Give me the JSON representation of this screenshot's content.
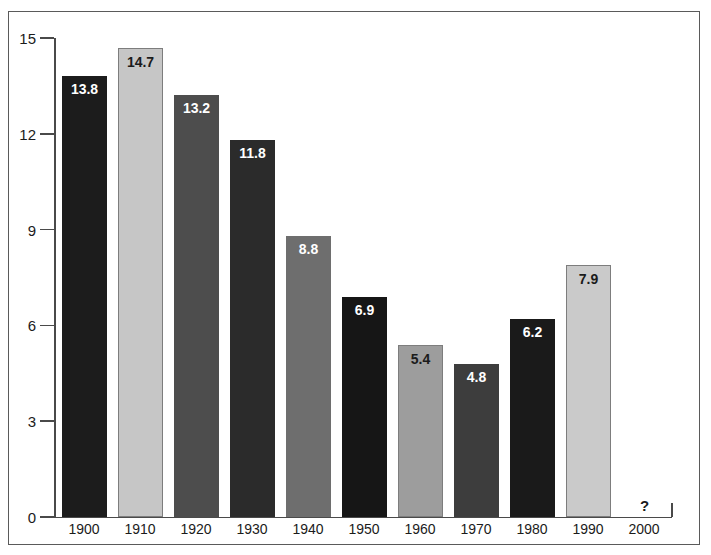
{
  "chart_data": {
    "type": "bar",
    "title": "",
    "subtitle": "",
    "xlabel": "",
    "ylabel": "",
    "categories": [
      "1900",
      "1910",
      "1920",
      "1930",
      "1940",
      "1950",
      "1960",
      "1970",
      "1980",
      "1990",
      "2000"
    ],
    "values": [
      13.8,
      14.7,
      13.2,
      11.8,
      8.8,
      6.9,
      5.4,
      4.8,
      6.2,
      7.9,
      null
    ],
    "value_labels": [
      "13.8",
      "14.7",
      "13.2",
      "11.8",
      "8.8",
      "6.9",
      "5.4",
      "4.8",
      "6.2",
      "7.9",
      "?"
    ],
    "bar_colors": [
      "#1c1c1c",
      "#c6c6c6",
      "#4d4d4d",
      "#2b2b2b",
      "#6e6e6e",
      "#161616",
      "#9d9d9d",
      "#3d3d3d",
      "#1a1a1a",
      "#cacaca",
      "none"
    ],
    "bar_label_color": [
      "#ffffff",
      "#1b1b1b",
      "#ffffff",
      "#ffffff",
      "#ffffff",
      "#ffffff",
      "#1b1b1b",
      "#ffffff",
      "#ffffff",
      "#1b1b1b",
      "#1b1b1b"
    ],
    "ylim": [
      0,
      15
    ],
    "yticks": [
      0,
      3,
      6,
      9,
      12,
      15
    ],
    "ytick_labels": [
      "0",
      "3",
      "6",
      "9",
      "12",
      "15"
    ],
    "grid": false,
    "legend": "none"
  },
  "axes": {
    "y_labels": [
      "15",
      "12",
      "9",
      "6",
      "3",
      "0"
    ],
    "x_labels": [
      "1900",
      "1910",
      "1920",
      "1930",
      "1940",
      "1950",
      "1960",
      "1970",
      "1980",
      "1990",
      "2000"
    ]
  },
  "bars": [
    {
      "category": "1900",
      "label": "13.8",
      "value": 13.8,
      "tone": "dark",
      "color": "#1c1c1c"
    },
    {
      "category": "1910",
      "label": "14.7",
      "value": 14.7,
      "tone": "light",
      "color": "#c6c6c6"
    },
    {
      "category": "1920",
      "label": "13.2",
      "value": 13.2,
      "tone": "dark",
      "color": "#4d4d4d"
    },
    {
      "category": "1930",
      "label": "11.8",
      "value": 11.8,
      "tone": "dark",
      "color": "#2b2b2b"
    },
    {
      "category": "1940",
      "label": "8.8",
      "value": 8.8,
      "tone": "dark",
      "color": "#6e6e6e"
    },
    {
      "category": "1950",
      "label": "6.9",
      "value": 6.9,
      "tone": "dark",
      "color": "#161616"
    },
    {
      "category": "1960",
      "label": "5.4",
      "value": 5.4,
      "tone": "light",
      "color": "#9d9d9d"
    },
    {
      "category": "1970",
      "label": "4.8",
      "value": 4.8,
      "tone": "dark",
      "color": "#3d3d3d"
    },
    {
      "category": "1980",
      "label": "6.2",
      "value": 6.2,
      "tone": "dark",
      "color": "#1a1a1a"
    },
    {
      "category": "1990",
      "label": "7.9",
      "value": 7.9,
      "tone": "light",
      "color": "#cacaca"
    }
  ],
  "unknown": {
    "category": "2000",
    "label": "?"
  },
  "style": {
    "axis_color": "#4a4a4a",
    "frame_color": "#5a5a5a",
    "text_color": "#1b1b1b",
    "background": "#ffffff"
  }
}
